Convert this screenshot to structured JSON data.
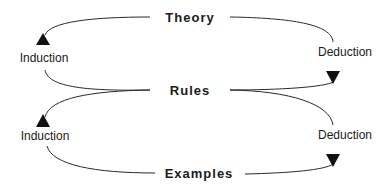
{
  "diagram": {
    "nodes": {
      "theory": "Theory",
      "rules": "Rules",
      "examples": "Examples"
    },
    "edges": {
      "upper_left": "Induction",
      "upper_right": "Deduction",
      "lower_left": "Induction",
      "lower_right": "Deduction"
    },
    "colors": {
      "line": "#2a2a2a",
      "text": "#1a1a1a",
      "background": "#ffffff"
    }
  }
}
